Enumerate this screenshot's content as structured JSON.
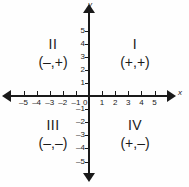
{
  "chart_data": {
    "type": "diagram",
    "xlabel": "x",
    "ylabel": "y",
    "xlim": [
      -5,
      5
    ],
    "ylim": [
      -5,
      5
    ],
    "grid": false,
    "origin_label": "0",
    "x_ticks": [
      {
        "value": -5,
        "label": "–5"
      },
      {
        "value": -4,
        "label": "–4"
      },
      {
        "value": -3,
        "label": "–3"
      },
      {
        "value": -2,
        "label": "–2"
      },
      {
        "value": -1,
        "label": "–1"
      },
      {
        "value": 1,
        "label": "1"
      },
      {
        "value": 2,
        "label": "2"
      },
      {
        "value": 3,
        "label": "3"
      },
      {
        "value": 4,
        "label": "4"
      },
      {
        "value": 5,
        "label": "5"
      }
    ],
    "y_ticks": [
      {
        "value": 5,
        "label": "5"
      },
      {
        "value": 4,
        "label": "4"
      },
      {
        "value": 3,
        "label": "3"
      },
      {
        "value": 2,
        "label": "2"
      },
      {
        "value": 1,
        "label": "1"
      },
      {
        "value": -1,
        "label": "–1"
      },
      {
        "value": -2,
        "label": "–2"
      },
      {
        "value": -3,
        "label": "–3"
      },
      {
        "value": -4,
        "label": "–4"
      },
      {
        "value": -5,
        "label": "–5"
      }
    ],
    "quadrants": [
      {
        "roman": "I",
        "signs": "(+,+)",
        "x_sign": "+",
        "y_sign": "+"
      },
      {
        "roman": "II",
        "signs": "(–,+)",
        "x_sign": "–",
        "y_sign": "+"
      },
      {
        "roman": "III",
        "signs": "(–,–)",
        "x_sign": "–",
        "y_sign": "–"
      },
      {
        "roman": "IV",
        "signs": "(+,–)",
        "x_sign": "+",
        "y_sign": "–"
      }
    ],
    "arrowheads": [
      "left",
      "right",
      "up",
      "down"
    ],
    "colors": {
      "axis": "#1a1a1a",
      "text": "#1a1a1a",
      "background": "#fefefe"
    }
  }
}
